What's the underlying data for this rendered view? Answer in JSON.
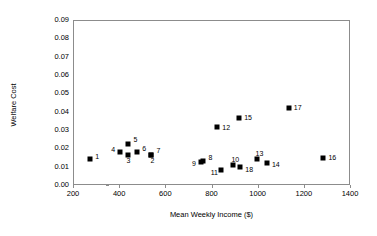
{
  "chart_data": {
    "type": "scatter",
    "title": "",
    "xlabel": "Mean Weekly Income ($)",
    "ylabel": "Welfare Cost",
    "xlim": [
      200,
      1400
    ],
    "ylim": [
      0.0,
      0.09
    ],
    "xticks": [
      200,
      400,
      600,
      800,
      1000,
      1200,
      1400
    ],
    "xtick_labels": [
      "200",
      "400",
      "600",
      "800",
      "1000",
      "1200",
      "1400"
    ],
    "yticks": [
      0.0,
      0.01,
      0.02,
      0.03,
      0.04,
      0.05,
      0.06,
      0.07,
      0.08,
      0.09
    ],
    "ytick_labels": [
      "0.00",
      "0.01",
      "0.02",
      "0.03",
      "0.04",
      "0.05",
      "0.06",
      "0.07",
      "0.08",
      "0.09"
    ],
    "grid": false,
    "legend": false,
    "marker": "filled-square",
    "marker_color": "#000000",
    "points": [
      {
        "label": "1",
        "x": 275,
        "y": 0.014,
        "label_dx": 5,
        "label_dy": -3
      },
      {
        "label": "2",
        "x": 540,
        "y": 0.0165,
        "label_dx": -1,
        "label_dy": 5
      },
      {
        "label": "3",
        "x": 440,
        "y": 0.0165,
        "label_dx": -2,
        "label_dy": 5
      },
      {
        "label": "4",
        "x": 405,
        "y": 0.018,
        "label_dx": -9,
        "label_dy": -3
      },
      {
        "label": "5",
        "x": 440,
        "y": 0.0225,
        "label_dx": 5,
        "label_dy": -5
      },
      {
        "label": "6",
        "x": 478,
        "y": 0.018,
        "label_dx": 5,
        "label_dy": -4
      },
      {
        "label": "7",
        "x": 540,
        "y": 0.0165,
        "label_dx": 5,
        "label_dy": -5
      },
      {
        "label": "8",
        "x": 765,
        "y": 0.013,
        "label_dx": 5,
        "label_dy": -4
      },
      {
        "label": "9",
        "x": 755,
        "y": 0.0123,
        "label_dx": -9,
        "label_dy": 1
      },
      {
        "label": "10",
        "x": 895,
        "y": 0.0108,
        "label_dx": -2,
        "label_dy": -6
      },
      {
        "label": "11",
        "x": 840,
        "y": 0.008,
        "label_dx": -10,
        "label_dy": 2
      },
      {
        "label": "12",
        "x": 825,
        "y": 0.0315,
        "label_dx": 5,
        "label_dy": 0
      },
      {
        "label": "13",
        "x": 995,
        "y": 0.0143,
        "label_dx": -1,
        "label_dy": -6
      },
      {
        "label": "14",
        "x": 1040,
        "y": 0.012,
        "label_dx": 5,
        "label_dy": 1
      },
      {
        "label": "15",
        "x": 920,
        "y": 0.0368,
        "label_dx": 5,
        "label_dy": -1
      },
      {
        "label": "16",
        "x": 1285,
        "y": 0.015,
        "label_dx": 5,
        "label_dy": -1
      },
      {
        "label": "17",
        "x": 1135,
        "y": 0.0418,
        "label_dx": 5,
        "label_dy": -1
      },
      {
        "label": "18",
        "x": 925,
        "y": 0.0098,
        "label_dx": 5,
        "label_dy": 2
      }
    ]
  }
}
